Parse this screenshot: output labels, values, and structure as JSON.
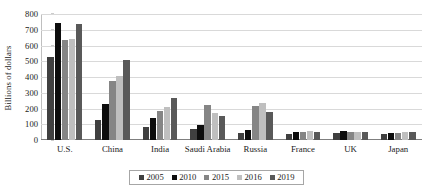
{
  "chart_data": {
    "type": "bar",
    "title": "",
    "subtitle": "",
    "xlabel": "",
    "ylabel": "Billions of dollars",
    "ylim": [
      0,
      800
    ],
    "ytick_labels": [
      "800",
      "700",
      "600",
      "500",
      "400",
      "300",
      "200",
      "100",
      "0"
    ],
    "ytick_values": [
      800,
      700,
      600,
      500,
      400,
      300,
      200,
      100,
      0
    ],
    "grid": true,
    "grid_axis": "y",
    "legend_position": "bottom",
    "bar_orientation": "vertical",
    "grouping": "clustered",
    "categories": [
      "U.S.",
      "China",
      "India",
      "Saudi Arabia",
      "Russia",
      "France",
      "UK",
      "Japan"
    ],
    "series": [
      {
        "name": "2005",
        "color": "#404040",
        "values": [
          525,
          125,
          85,
          70,
          45,
          40,
          45,
          40
        ]
      },
      {
        "name": "2010",
        "color": "#0d0d0d",
        "values": [
          740,
          230,
          140,
          95,
          65,
          50,
          55,
          45
        ]
      },
      {
        "name": "2015",
        "color": "#858585",
        "values": [
          635,
          375,
          185,
          225,
          215,
          50,
          50,
          45
        ]
      },
      {
        "name": "2016",
        "color": "#bfbfbf",
        "values": [
          640,
          405,
          210,
          170,
          235,
          55,
          50,
          50
        ]
      },
      {
        "name": "2019",
        "color": "#595959",
        "values": [
          735,
          510,
          265,
          150,
          180,
          50,
          50,
          50
        ]
      }
    ],
    "annotations": []
  },
  "figure": {
    "background_color": "#ffffff",
    "gridline_color": "#d9d9d9",
    "axis_color": "#7f7f7f",
    "text_color": "#1a1a1a",
    "legend_border_color": "#a6a6a6"
  }
}
